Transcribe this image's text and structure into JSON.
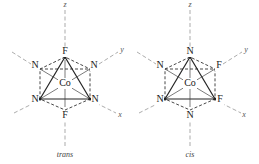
{
  "figure": {
    "molecules": [
      {
        "id": "trans",
        "caption": "trans",
        "center": "Co",
        "ligands": {
          "top": "F",
          "bottom": "F",
          "upper_left": "N",
          "upper_right": "N",
          "lower_left": "N",
          "lower_right": "N"
        },
        "axes": {
          "z": "z",
          "y": "y",
          "x": "x"
        }
      },
      {
        "id": "cis",
        "caption": "cis",
        "center": "Co",
        "ligands": {
          "top": "N",
          "bottom": "N",
          "upper_left": "N",
          "upper_right": "F",
          "lower_left": "N",
          "lower_right": "F"
        },
        "axes": {
          "z": "z",
          "y": "y",
          "x": "x"
        }
      }
    ]
  }
}
